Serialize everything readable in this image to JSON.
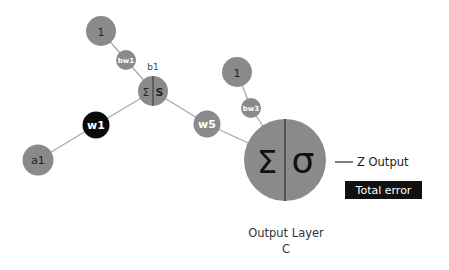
{
  "colors": {
    "node_fill": "#8a8a8a",
    "edge": "#a9a9a9",
    "highlight_fill": "#0a0a0a",
    "text_dark": "#222222",
    "text_light": "#ffffff",
    "label_text": "#444444",
    "box_fill": "#111111"
  },
  "nodes": {
    "bias_hidden": {
      "label": "1"
    },
    "bias_weight_hidden": {
      "label": "bw1"
    },
    "hidden_bias_label": {
      "label": "b1"
    },
    "hidden_neuron": {
      "sum_symbol": "Σ",
      "activation_symbol": "S"
    },
    "weight_w1": {
      "label": "w1"
    },
    "input_a1": {
      "label": "a1"
    },
    "weight_w5": {
      "label": "w5"
    },
    "bias_output": {
      "label": "1"
    },
    "bias_weight_output": {
      "label": "bw3"
    },
    "output_neuron": {
      "sum_symbol": "Σ",
      "activation_symbol": "σ"
    }
  },
  "labels": {
    "z_output": "Z Output",
    "total_error": "Total error",
    "output_layer_line1": "Output Layer",
    "output_layer_line2": "C"
  }
}
